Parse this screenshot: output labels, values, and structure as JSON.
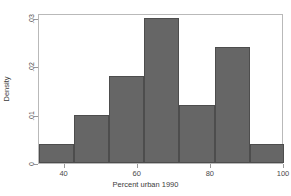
{
  "chart_data": {
    "type": "bar",
    "title": "",
    "xlabel": "Percent urban 1990",
    "ylabel": "Density",
    "xlim": [
      33,
      100
    ],
    "ylim": [
      0,
      0.031
    ],
    "xticks": [
      40,
      60,
      80,
      100
    ],
    "xtick_labels": [
      "40",
      "60",
      "80",
      "100"
    ],
    "yticks": [
      0,
      0.01,
      0.02,
      0.03
    ],
    "ytick_labels": [
      "0",
      ".01",
      ".02",
      ".03"
    ],
    "grid": false,
    "legend": null,
    "bar_color": "#666666",
    "bar_edge_color": "#4d4d4d",
    "frame_color": "#b9b9b9",
    "background": "#ffffff",
    "bin_edges": [
      33.0,
      42.6,
      52.2,
      61.8,
      71.4,
      81.0,
      90.6,
      100.0
    ],
    "categories": [
      "33.0-42.6",
      "42.6-52.2",
      "52.2-61.8",
      "61.8-71.4",
      "71.4-81.0",
      "81.0-90.6",
      "90.6-100.0"
    ],
    "values": [
      0.004,
      0.01,
      0.018,
      0.03,
      0.012,
      0.024,
      0.004
    ]
  }
}
